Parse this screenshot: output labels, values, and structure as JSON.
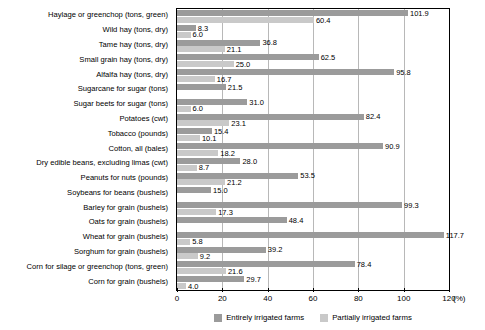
{
  "chart_data": {
    "type": "bar",
    "orientation": "horizontal",
    "title": "",
    "xlabel": "(%)",
    "ylabel": "",
    "xlim": [
      0,
      120
    ],
    "xticks": [
      0,
      20,
      40,
      60,
      80,
      100,
      120
    ],
    "grid": true,
    "legend_position": "bottom-center",
    "categories": [
      "Haylage or greenchop (tons, green)",
      "Wild hay (tons, dry)",
      "Tame hay (tons, dry)",
      "Small grain hay (tons, dry)",
      "Alfalfa hay (tons, dry)",
      "Sugarcane for sugar (tons)",
      "Sugar beets for sugar (tons)",
      "Potatoes (cwt)",
      "Tobacco (pounds)",
      "Cotton, all (bales)",
      "Dry edible beans, excluding limas (cwt)",
      "Peanuts for nuts (pounds)",
      "Soybeans for beans (bushels)",
      "Barley for grain (bushels)",
      "Oats for grain (bushels)",
      "Wheat for grain (bushels)",
      "Sorghum for grain (bushels)",
      "Corn for silage or greenchop (tons, green)",
      "Corn for grain (bushels)"
    ],
    "series": [
      {
        "name": "Entirely irrigated farms",
        "color": "#9b9b9b",
        "values": [
          101.9,
          8.3,
          36.8,
          62.5,
          95.8,
          21.5,
          31.0,
          82.4,
          15.4,
          90.9,
          28.0,
          53.5,
          15.0,
          99.3,
          48.4,
          117.7,
          39.2,
          78.4,
          29.7
        ]
      },
      {
        "name": "Partially irrigated farms",
        "color": "#c9c9c9",
        "values": [
          60.4,
          6.0,
          21.1,
          25.0,
          16.7,
          null,
          6.0,
          23.1,
          10.1,
          18.2,
          8.7,
          21.2,
          null,
          17.3,
          null,
          5.8,
          9.2,
          21.6,
          4.0
        ]
      }
    ],
    "value_labels": {
      "Haylage or greenchop (tons, green)": {
        "a": "101.9",
        "b": "60.4"
      },
      "Wild hay (tons, dry)": {
        "a": "8.3",
        "b": "6.0"
      },
      "Tame hay (tons, dry)": {
        "a": "36.8",
        "b": "21.1"
      },
      "Small grain hay (tons, dry)": {
        "a": "62.5",
        "b": "25.0"
      },
      "Alfalfa hay (tons, dry)": {
        "a": "95.8",
        "b": "16.7"
      },
      "Sugarcane for sugar (tons)": {
        "a": "21.5",
        "b": ""
      },
      "Sugar beets for sugar (tons)": {
        "a": "31.0",
        "b": "6.0"
      },
      "Potatoes (cwt)": {
        "a": "82.4",
        "b": "23.1"
      },
      "Tobacco (pounds)": {
        "a": "15.4",
        "b": "10.1"
      },
      "Cotton, all (bales)": {
        "a": "90.9",
        "b": "18.2"
      },
      "Dry edible beans, excluding limas (cwt)": {
        "a": "28.0",
        "b": "8.7"
      },
      "Peanuts for nuts (pounds)": {
        "a": "53.5",
        "b": "21.2"
      },
      "Soybeans for beans (bushels)": {
        "a": "15.0",
        "b": ""
      },
      "Barley for grain (bushels)": {
        "a": "99.3",
        "b": "17.3"
      },
      "Oats for grain (bushels)": {
        "a": "48.4",
        "b": ""
      },
      "Wheat for grain (bushels)": {
        "a": "117.7",
        "b": "5.8"
      },
      "Sorghum for grain (bushels)": {
        "a": "39.2",
        "b": "9.2"
      },
      "Corn for silage or greenchop (tons, green)": {
        "a": "78.4",
        "b": "21.6"
      },
      "Corn for grain (bushels)": {
        "a": "29.7",
        "b": "4.0"
      }
    }
  },
  "axis": {
    "unit_label": "(%)",
    "tick_labels": [
      "0",
      "20",
      "40",
      "60",
      "80",
      "100",
      "120"
    ]
  },
  "legend": {
    "items": [
      {
        "label": "Entirely irrigated farms",
        "color": "#9b9b9b"
      },
      {
        "label": "Partially irrigated farms",
        "color": "#c9c9c9"
      }
    ]
  }
}
